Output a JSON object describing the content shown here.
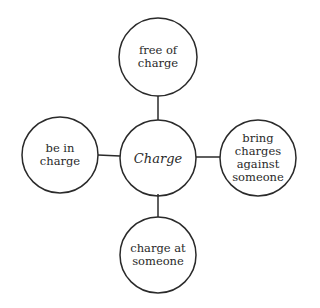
{
  "diagram": {
    "type": "mind-map",
    "center": {
      "label": "Charge"
    },
    "nodes": [
      {
        "position": "top",
        "label": "free of\ncharge"
      },
      {
        "position": "left",
        "label": "be in\ncharge"
      },
      {
        "position": "right",
        "label": "bring\ncharges\nagainst\nsomeone"
      },
      {
        "position": "bottom",
        "label": "charge at\nsomeone"
      }
    ],
    "colors": {
      "stroke": "#2a2a2a",
      "background": "#ffffff",
      "text": "#2a2a2a"
    }
  }
}
